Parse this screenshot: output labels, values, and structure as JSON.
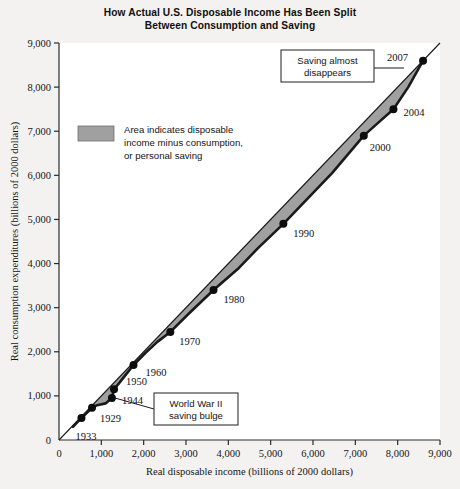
{
  "chart_data": {
    "type": "area",
    "title": "How Actual U.S. Disposable Income Has Been Split Between Consumption and Saving",
    "title_line1": "How Actual U.S. Disposable Income Has Been Split",
    "title_line2": "Between Consumption and Saving",
    "xlabel": "Real disposable income (billions of 2000 dollars)",
    "ylabel": "Real consumption expenditures (billions of 2000 dollars)",
    "xlim": [
      0,
      9000
    ],
    "ylim": [
      0,
      9000
    ],
    "xticks": [
      "0",
      "1,000",
      "2,000",
      "3,000",
      "4,000",
      "5,000",
      "6,000",
      "7,000",
      "8,000",
      "9,000"
    ],
    "yticks": [
      "0",
      "1,000",
      "2,000",
      "3,000",
      "4,000",
      "5,000",
      "6,000",
      "7,000",
      "8,000",
      "9,000"
    ],
    "grid": false,
    "legend_position": "upper-left-inside",
    "series": [
      {
        "name": "45-degree line (disposable income)",
        "style": "thin-line",
        "x": [
          0,
          9000
        ],
        "values": [
          0,
          9000
        ]
      },
      {
        "name": "Real consumption expenditures",
        "style": "thick-line-with-markers",
        "x": [
          330,
          530,
          780,
          900,
          1100,
          1250,
          1300,
          1420,
          1560,
          1760,
          2050,
          2330,
          2630,
          3050,
          3650,
          4250,
          4700,
          5300,
          5900,
          6450,
          7200,
          7550,
          7900,
          8250,
          8600
        ],
        "values": [
          300,
          500,
          730,
          790,
          830,
          950,
          1150,
          1290,
          1460,
          1700,
          1980,
          2230,
          2450,
          2850,
          3400,
          3900,
          4350,
          4900,
          5500,
          6050,
          6900,
          7200,
          7500,
          8000,
          8600
        ]
      }
    ],
    "labeled_points": [
      {
        "label": "1933",
        "x": 530,
        "y": 500,
        "label_dx": -6,
        "label_dy": 22
      },
      {
        "label": "1929",
        "x": 780,
        "y": 730,
        "label_dx": 8,
        "label_dy": 14
      },
      {
        "label": "1944",
        "x": 1250,
        "y": 950,
        "label_dx": 10,
        "label_dy": 6
      },
      {
        "label": "1950",
        "x": 1300,
        "y": 1150,
        "label_dx": 12,
        "label_dy": -4
      },
      {
        "label": "1960",
        "x": 1760,
        "y": 1700,
        "label_dx": 12,
        "label_dy": 11
      },
      {
        "label": "1970",
        "x": 2630,
        "y": 2450,
        "label_dx": 9,
        "label_dy": 13
      },
      {
        "label": "1980",
        "x": 3650,
        "y": 3400,
        "label_dx": 10,
        "label_dy": 13
      },
      {
        "label": "1990",
        "x": 5300,
        "y": 4900,
        "label_dx": 10,
        "label_dy": 13
      },
      {
        "label": "2000",
        "x": 7200,
        "y": 6900,
        "label_dx": 6,
        "label_dy": 15
      },
      {
        "label": "2004",
        "x": 7900,
        "y": 7500,
        "label_dx": 10,
        "label_dy": 7
      },
      {
        "label": "2007",
        "x": 8600,
        "y": 8600,
        "label_dx": -36,
        "label_dy": 0
      }
    ],
    "legend": {
      "swatch_color": "#a0a0a0",
      "line1": "Area indicates disposable",
      "line2": "income minus consumption,",
      "line3": "or personal saving"
    },
    "annotations": [
      {
        "name": "saving-almost-disappears",
        "line1": "Saving almost",
        "line2": "disappears",
        "box": {
          "x": 281,
          "y": 50,
          "w": 93,
          "h": 32
        },
        "leader": [
          [
            374,
            68
          ],
          [
            404,
            68
          ]
        ]
      },
      {
        "name": "world-war-ii-saving-bulge",
        "line1": "World War II",
        "line2": "saving bulge",
        "box": {
          "x": 154,
          "y": 393,
          "w": 84,
          "h": 32
        },
        "leader": [
          [
            154,
            409
          ],
          [
            115,
            398
          ]
        ]
      }
    ],
    "colors": {
      "background": "#f3f2f1",
      "plot_background": "#ffffff",
      "saving_area": "#a0a0a0",
      "consumption_line": "#1a1a1a",
      "reference_line": "#1a1a1a",
      "axis": "#2a2a2a",
      "text": "#111111"
    }
  }
}
